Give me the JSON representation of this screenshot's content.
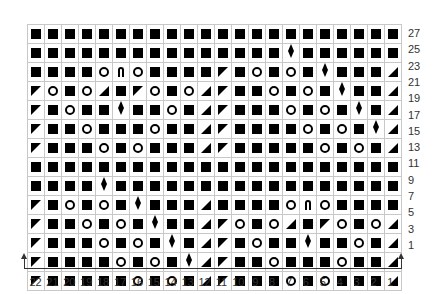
{
  "legend_symbols": {
    "S": "knit-square",
    "O": "yarn-over-circle",
    "L": "ssk-left-triangle",
    "R": "k2tog-right-triangle",
    "D": "diamond-leaf",
    "A": "arch-symbol"
  },
  "columns": [
    "22",
    "21",
    "20",
    "19",
    "18",
    "17",
    "16",
    "15",
    "14",
    "13",
    "12",
    "11",
    "10",
    "9",
    "8",
    "7",
    "6",
    "5",
    "4",
    "3",
    "2",
    "1"
  ],
  "rows": [
    {
      "label": "27",
      "cells": "SSSSSSSSSSSSSSSSSSSSSS"
    },
    {
      "label": "25",
      "cells": "SSSSSSSSSSSSSSSDSSSSSS"
    },
    {
      "label": "23",
      "cells": "SSSSOAOSSSSLSOSOSDSSSR"
    },
    {
      "label": "21",
      "cells": "LOSORSLOSORLSSOSOSDSSR"
    },
    {
      "label": "19",
      "cells": "LSOSSDSSOSRLSSSOSOSDSR"
    },
    {
      "label": "17",
      "cells": "LSSOSSSOSSRLSSSSOSOSDR"
    },
    {
      "label": "15",
      "cells": "LSSSOSOSSSRLSSSSSOSOSR"
    },
    {
      "label": "13",
      "cells": "SSSSSSSSSSSSSSSSSSSSSS"
    },
    {
      "label": "11",
      "cells": "SSSSDSSSSSSSSSSSSSSSSS"
    },
    {
      "label": "9",
      "cells": "LSOSOSDSSSRSSSSOAOSSSS"
    },
    {
      "label": "7",
      "cells": "LSSOSOSDSSRLOSORSLOSOR"
    },
    {
      "label": "5",
      "cells": "LSSSOSOSDSRLSOSSDSSOSR"
    },
    {
      "label": "3",
      "cells": "LSSSSOSOSDRLSSOSSSOSSR"
    },
    {
      "label": "1",
      "cells": "LSSSSSOSOSRLSSSOSOSSSR"
    }
  ]
}
